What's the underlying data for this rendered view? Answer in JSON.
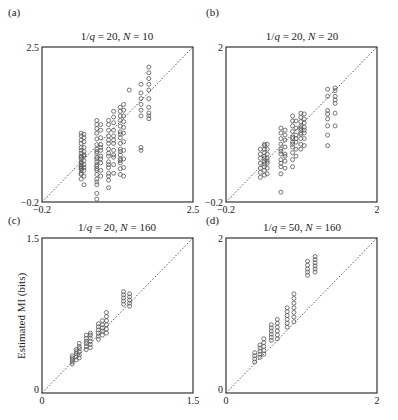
{
  "figure": {
    "ylabel": "Estimated MI (bits)"
  },
  "chart_data": [
    {
      "type": "scatter",
      "panel": "(a)",
      "title": "1/q = 20, N = 10",
      "title_parts": {
        "q_prefix": "1/",
        "q": "q",
        "q_value": " = 20, ",
        "n": "N",
        "n_value": " = 10"
      },
      "xlabel": "",
      "ylabel": "",
      "xlim": [
        -0.2,
        2.5
      ],
      "ylim": [
        -0.2,
        2.5
      ],
      "x_ticks": [
        "-0.2",
        "2.5"
      ],
      "y_ticks": [
        "-0.2",
        "2.5"
      ],
      "reference_line": "y = x (dotted)",
      "grid": false,
      "clusters": [
        {
          "x": 0.5,
          "y": [
            0.2,
            0.28,
            0.35,
            0.4,
            0.45,
            0.5,
            0.55,
            0.6,
            0.65,
            0.7,
            0.75,
            0.82,
            0.88,
            0.95,
            1.0,
            0.42,
            0.48,
            0.58,
            0.3,
            0.38
          ]
        },
        {
          "x": 0.55,
          "y": [
            0.1,
            0.25,
            0.35,
            0.45,
            0.52,
            0.6,
            0.68,
            0.75,
            0.85,
            0.92,
            0.98,
            0.4,
            0.62
          ]
        },
        {
          "x": 0.78,
          "y": [
            -0.15,
            -0.05,
            0.1,
            0.2,
            0.28,
            0.35,
            0.42,
            0.5,
            0.58,
            0.65,
            0.72,
            0.8,
            0.9,
            1.0,
            1.08,
            1.15,
            1.22,
            0.45,
            0.55,
            0.68,
            0.15,
            0.38
          ]
        },
        {
          "x": 0.85,
          "y": [
            0.25,
            0.35,
            0.48,
            0.6,
            0.7,
            0.8,
            0.92,
            1.05,
            1.15,
            0.55,
            0.75
          ]
        },
        {
          "x": 0.99,
          "y": [
            0.05,
            0.18,
            0.3,
            0.4,
            0.5,
            0.6,
            0.72,
            0.82,
            0.95,
            1.05,
            1.15,
            1.22,
            0.45,
            0.65,
            0.88,
            0.25
          ]
        },
        {
          "x": 1.08,
          "y": [
            0.3,
            0.45,
            0.58,
            0.7,
            0.82,
            0.95,
            1.05,
            1.18,
            1.28,
            1.38,
            0.62,
            0.88
          ]
        },
        {
          "x": 1.2,
          "y": [
            0.28,
            0.38,
            0.48,
            0.55,
            0.62,
            0.72,
            0.82,
            0.92,
            1.02,
            1.12,
            1.22,
            1.3,
            1.38,
            1.45,
            0.52,
            0.68,
            0.98
          ]
        },
        {
          "x": 1.26,
          "y": [
            0.25,
            0.4,
            0.55,
            0.7,
            0.85,
            1.0,
            1.1,
            1.2,
            1.3,
            1.4,
            1.5
          ]
        },
        {
          "x": 1.36,
          "y": [
            1.75
          ]
        },
        {
          "x": 1.57,
          "y": [
            0.7,
            0.75,
            1.3,
            1.4,
            1.5,
            1.6,
            1.7,
            1.85
          ]
        },
        {
          "x": 1.71,
          "y": [
            1.25,
            1.3,
            1.35,
            1.45,
            1.6,
            1.75,
            1.85,
            1.95,
            2.05,
            2.15
          ]
        }
      ]
    },
    {
      "type": "scatter",
      "panel": "(b)",
      "title": "1/q = 20, N = 20",
      "title_parts": {
        "q_prefix": "1/",
        "q": "q",
        "q_value": " = 20, ",
        "n": "N",
        "n_value": " = 20"
      },
      "xlabel": "",
      "ylabel": "",
      "xlim": [
        -0.2,
        2.0
      ],
      "ylim": [
        -0.2,
        2.0
      ],
      "x_ticks": [
        "-0.2",
        "2"
      ],
      "y_ticks": [
        "-0.2",
        "2"
      ],
      "reference_line": "y = x (dotted)",
      "grid": false,
      "clusters": [
        {
          "x": 0.3,
          "y": [
            0.15,
            0.22,
            0.28,
            0.35,
            0.42,
            0.48,
            0.55
          ]
        },
        {
          "x": 0.36,
          "y": [
            0.18,
            0.25,
            0.3,
            0.38,
            0.45,
            0.5,
            0.55,
            0.6,
            0.62,
            0.34,
            0.42
          ]
        },
        {
          "x": 0.4,
          "y": [
            0.2,
            0.28,
            0.35,
            0.42,
            0.48,
            0.55,
            0.62,
            0.38
          ]
        },
        {
          "x": 0.6,
          "y": [
            -0.06,
            0.2,
            0.3,
            0.4,
            0.48,
            0.55,
            0.62,
            0.7,
            0.78,
            0.85,
            0.35,
            0.52
          ]
        },
        {
          "x": 0.66,
          "y": [
            0.28,
            0.38,
            0.48,
            0.58,
            0.68,
            0.75,
            0.82,
            0.45
          ]
        },
        {
          "x": 0.77,
          "y": [
            0.3,
            0.4,
            0.5,
            0.58,
            0.65,
            0.72,
            0.8,
            0.88,
            0.95,
            1.02,
            0.62,
            0.7
          ]
        },
        {
          "x": 0.82,
          "y": [
            0.45,
            0.55,
            0.65,
            0.75,
            0.85,
            0.95,
            0.7
          ]
        },
        {
          "x": 0.89,
          "y": [
            0.55,
            0.62,
            0.7,
            0.76,
            0.82,
            0.88,
            0.94,
            1.0,
            1.06,
            0.78,
            0.85
          ]
        },
        {
          "x": 0.94,
          "y": [
            0.6,
            0.7,
            0.78,
            0.86,
            0.92,
            0.98,
            1.05,
            0.82
          ]
        },
        {
          "x": 1.28,
          "y": [
            0.6,
            0.75,
            0.88,
            0.98,
            1.05,
            1.1,
            1.3,
            1.4
          ]
        },
        {
          "x": 1.39,
          "y": [
            0.88,
            1.06,
            1.2,
            1.25,
            1.3,
            1.38,
            1.42
          ]
        }
      ]
    },
    {
      "type": "scatter",
      "panel": "(c)",
      "title": "1/q = 20, N = 160",
      "title_parts": {
        "q_prefix": "1/",
        "q": "q",
        "q_value": " = 20, ",
        "n": "N",
        "n_value": " = 160"
      },
      "xlabel": "",
      "ylabel": "Estimated MI (bits)",
      "xlim": [
        0,
        1.5
      ],
      "ylim": [
        0,
        1.5
      ],
      "x_ticks": [
        "0",
        "1.5"
      ],
      "y_ticks": [
        "0",
        "1.5"
      ],
      "reference_line": "y = x (dotted)",
      "grid": false,
      "clusters": [
        {
          "x": 0.3,
          "y": [
            0.28,
            0.3,
            0.32,
            0.34,
            0.36
          ]
        },
        {
          "x": 0.34,
          "y": [
            0.32,
            0.35,
            0.38,
            0.4,
            0.42
          ]
        },
        {
          "x": 0.37,
          "y": [
            0.34,
            0.37,
            0.4,
            0.43,
            0.45,
            0.48
          ]
        },
        {
          "x": 0.44,
          "y": [
            0.42,
            0.45,
            0.48,
            0.5,
            0.53,
            0.56
          ]
        },
        {
          "x": 0.48,
          "y": [
            0.44,
            0.47,
            0.5,
            0.53,
            0.56,
            0.58
          ]
        },
        {
          "x": 0.56,
          "y": [
            0.52,
            0.55,
            0.58,
            0.61,
            0.64,
            0.67
          ]
        },
        {
          "x": 0.6,
          "y": [
            0.56,
            0.6,
            0.63,
            0.66,
            0.7
          ]
        },
        {
          "x": 0.64,
          "y": [
            0.58,
            0.62,
            0.66,
            0.7,
            0.74,
            0.78
          ]
        },
        {
          "x": 0.81,
          "y": [
            0.86,
            0.89,
            0.92,
            0.95,
            0.98
          ]
        },
        {
          "x": 0.87,
          "y": [
            0.84,
            0.87,
            0.9,
            0.93,
            0.96
          ]
        }
      ]
    },
    {
      "type": "scatter",
      "panel": "(d)",
      "title": "1/q = 50, N = 160",
      "title_parts": {
        "q_prefix": "1/",
        "q": "q",
        "q_value": " = 50, ",
        "n": "N",
        "n_value": " = 160"
      },
      "xlabel": "",
      "ylabel": "",
      "xlim": [
        0,
        2.0
      ],
      "ylim": [
        0,
        2.0
      ],
      "x_ticks": [
        "0",
        "2"
      ],
      "y_ticks": [
        "0",
        "2"
      ],
      "reference_line": "y = x (dotted)",
      "grid": false,
      "clusters": [
        {
          "x": 0.38,
          "y": [
            0.4,
            0.44,
            0.48,
            0.52
          ]
        },
        {
          "x": 0.45,
          "y": [
            0.46,
            0.5,
            0.54,
            0.58,
            0.62
          ]
        },
        {
          "x": 0.5,
          "y": [
            0.5,
            0.55,
            0.6,
            0.65,
            0.7
          ]
        },
        {
          "x": 0.6,
          "y": [
            0.68,
            0.72,
            0.76,
            0.8,
            0.84,
            0.88
          ]
        },
        {
          "x": 0.68,
          "y": [
            0.7,
            0.75,
            0.8,
            0.85,
            0.9,
            0.95
          ]
        },
        {
          "x": 0.81,
          "y": [
            0.85,
            0.9,
            0.95,
            1.0,
            1.05,
            1.1
          ]
        },
        {
          "x": 0.9,
          "y": [
            0.92,
            0.98,
            1.04,
            1.1,
            1.16,
            1.22,
            1.28
          ]
        },
        {
          "x": 1.08,
          "y": [
            1.52,
            1.56,
            1.6,
            1.65,
            1.7
          ]
        },
        {
          "x": 1.18,
          "y": [
            1.56,
            1.6,
            1.64,
            1.68,
            1.72,
            1.76
          ]
        }
      ]
    }
  ]
}
